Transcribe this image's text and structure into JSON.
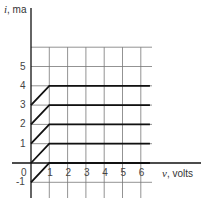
{
  "chart_data": {
    "type": "line",
    "title": "",
    "xlabel_symbol": "v",
    "xlabel_unit": ", volts",
    "ylabel_symbol": "i",
    "ylabel_unit": ", ma",
    "x_ticks": [
      "1",
      "2",
      "3",
      "4",
      "5",
      "6"
    ],
    "y_ticks": [
      "5",
      "4",
      "3",
      "2",
      "1",
      "0",
      "-1"
    ],
    "xlim": [
      0,
      6.5
    ],
    "ylim": [
      -1,
      6
    ],
    "grid": true,
    "legend": null,
    "series": [
      {
        "name": "I=0",
        "points": [
          [
            0,
            -1
          ],
          [
            1,
            0
          ],
          [
            6.5,
            0
          ]
        ]
      },
      {
        "name": "I=1",
        "points": [
          [
            0,
            0
          ],
          [
            1,
            1
          ],
          [
            6.5,
            1
          ]
        ]
      },
      {
        "name": "I=2",
        "points": [
          [
            0,
            1
          ],
          [
            1,
            2
          ],
          [
            6.5,
            2
          ]
        ]
      },
      {
        "name": "I=3",
        "points": [
          [
            0,
            2
          ],
          [
            1,
            3
          ],
          [
            6.5,
            3
          ]
        ]
      },
      {
        "name": "I=4",
        "points": [
          [
            0,
            3
          ],
          [
            1,
            4
          ],
          [
            6.5,
            4
          ]
        ]
      }
    ]
  },
  "labels": {
    "y_axis": {
      "symbol": "i",
      "unit": ", ma"
    },
    "x_axis": {
      "symbol": "v",
      "unit": ", volts"
    },
    "origin": "0"
  },
  "colors": {
    "grid": "#777777",
    "axis": "#111111",
    "curve": "#111111"
  }
}
